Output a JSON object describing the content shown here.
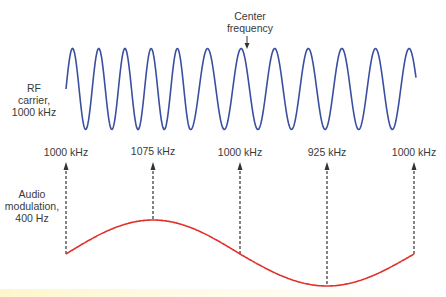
{
  "diagram": {
    "type": "frequency-modulation",
    "annotations": {
      "center_frequency": [
        "Center",
        "frequency"
      ],
      "rf_carrier": [
        "RF",
        "carrier,",
        "1000 kHz"
      ],
      "audio_modulation": [
        "Audio",
        "modulation,",
        "400 Hz"
      ]
    },
    "frequency_markers": [
      {
        "label": "1000 kHz",
        "x": 66,
        "curve_y": 254
      },
      {
        "label": "1075 kHz",
        "x": 153,
        "curve_y": 220
      },
      {
        "label": "1000 kHz",
        "x": 240,
        "curve_y": 254
      },
      {
        "label": "925 kHz",
        "x": 327,
        "curve_y": 286
      },
      {
        "label": "1000 kHz",
        "x": 414,
        "curve_y": 254
      }
    ],
    "colors": {
      "carrier_wave": "#3b4fa0",
      "modulation_wave": "#e0312b",
      "arrows": "#333333",
      "text": "#3a3a3a"
    }
  }
}
